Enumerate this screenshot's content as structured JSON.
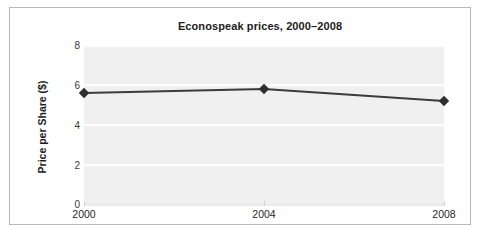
{
  "chart_data": {
    "type": "line",
    "title": "Econospeak prices, 2000–2008",
    "xlabel": "",
    "ylabel": "Price per Share ($)",
    "x": [
      2000,
      2004,
      2008
    ],
    "categories": [
      "2000",
      "2004",
      "2008"
    ],
    "values": [
      5.6,
      5.8,
      5.2
    ],
    "series": [
      {
        "name": "Price per Share",
        "values": [
          5.6,
          5.8,
          5.2
        ]
      }
    ],
    "xlim": [
      2000,
      2008
    ],
    "ylim": [
      0,
      8
    ],
    "yticks": [
      8,
      6,
      4,
      2,
      0
    ],
    "ytick_labels": [
      "8",
      "6",
      "4",
      "2",
      "0"
    ],
    "xticks": [
      2000,
      2004,
      2008
    ],
    "xtick_labels": [
      "2000",
      "2004",
      "2008"
    ],
    "grid": "horizontal-white-gridlines",
    "legend": "none",
    "marker": "diamond",
    "colors": {
      "line": "#3c3c3c",
      "marker": "#2e2e2e",
      "plot_background": "#f0f0f0",
      "gridline": "#fdfdfd",
      "frame_border": "#b9b9b9",
      "text": "#1d1d1d",
      "figure_background": "#ffffff"
    }
  }
}
